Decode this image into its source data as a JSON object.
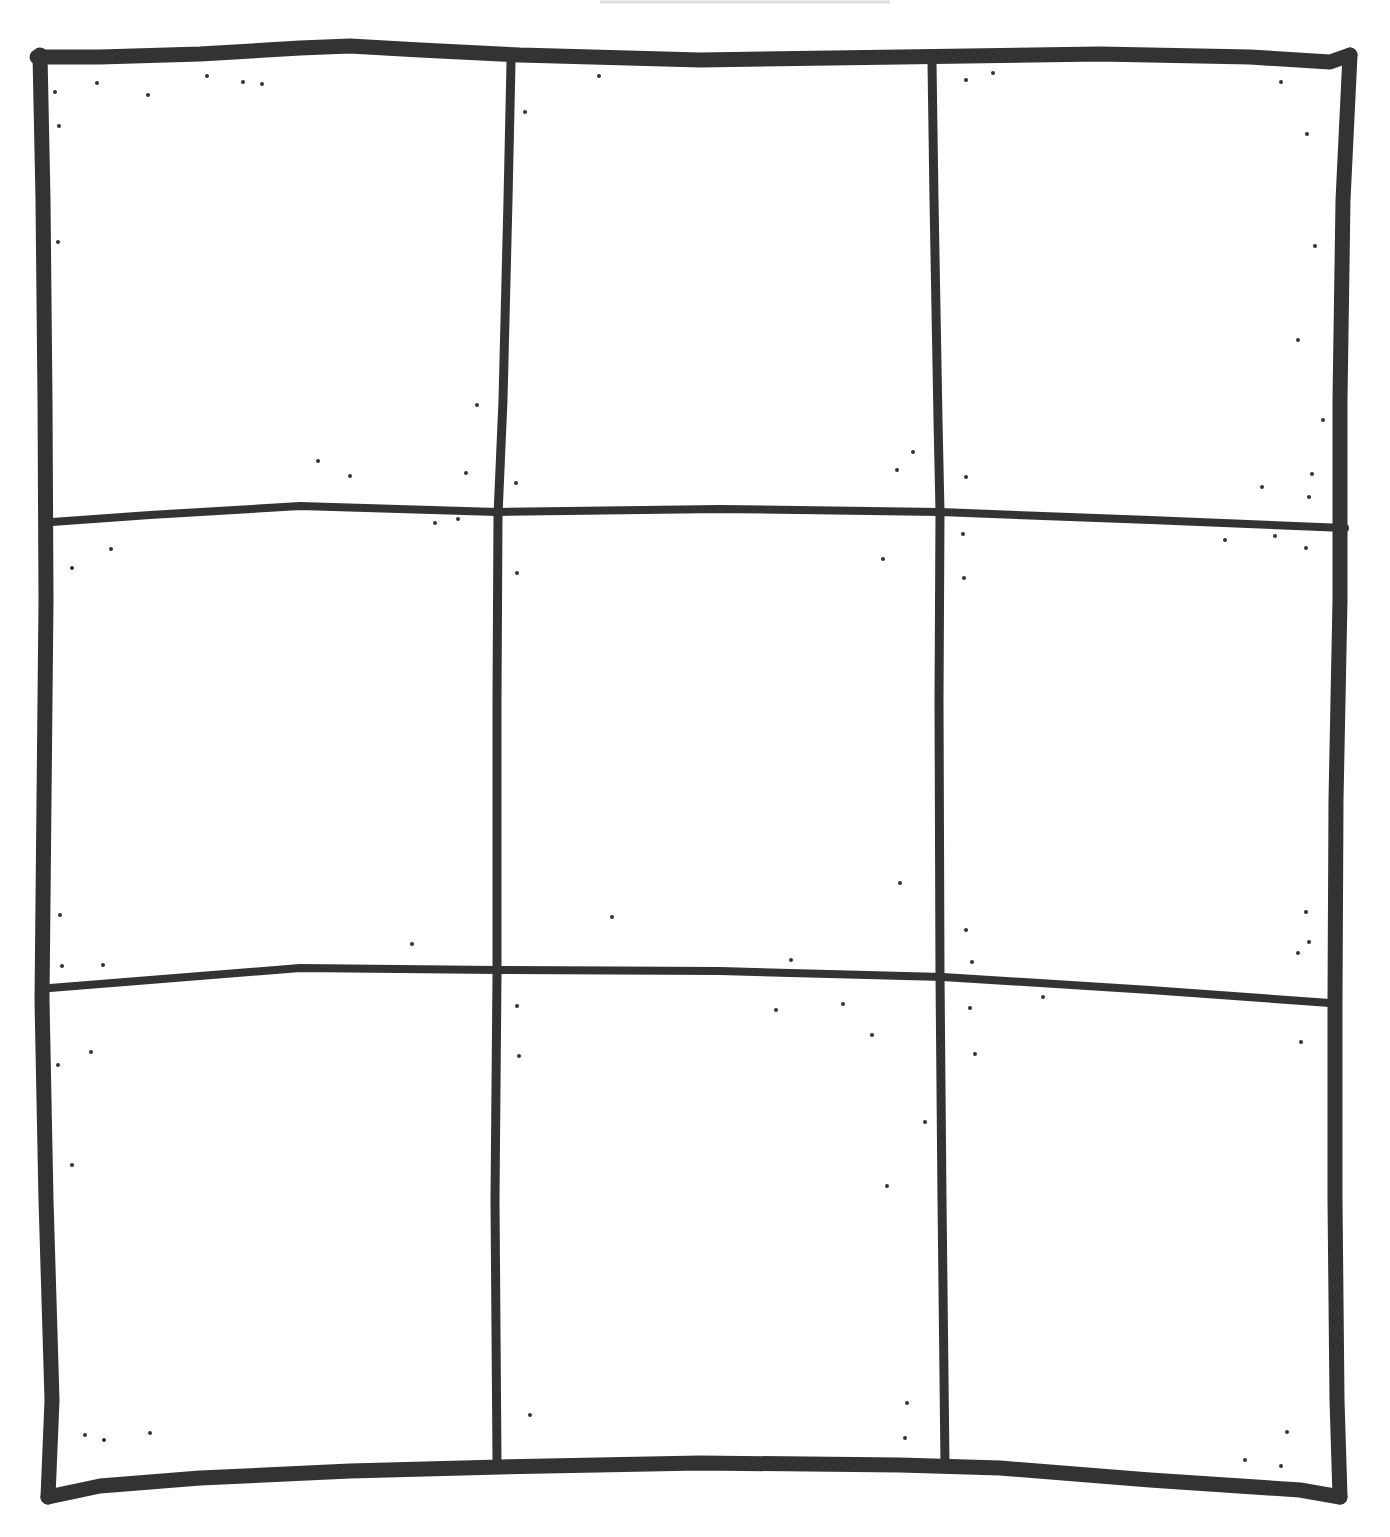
{
  "board": {
    "rows": 3,
    "columns": 3,
    "ink_color": "#333333",
    "paper_color": "#ffffff",
    "cells": [
      {
        "row": 0,
        "col": 0,
        "mark": ""
      },
      {
        "row": 0,
        "col": 1,
        "mark": ""
      },
      {
        "row": 0,
        "col": 2,
        "mark": ""
      },
      {
        "row": 1,
        "col": 0,
        "mark": ""
      },
      {
        "row": 1,
        "col": 1,
        "mark": ""
      },
      {
        "row": 1,
        "col": 2,
        "mark": ""
      },
      {
        "row": 2,
        "col": 0,
        "mark": ""
      },
      {
        "row": 2,
        "col": 1,
        "mark": ""
      },
      {
        "row": 2,
        "col": 2,
        "mark": ""
      }
    ]
  }
}
